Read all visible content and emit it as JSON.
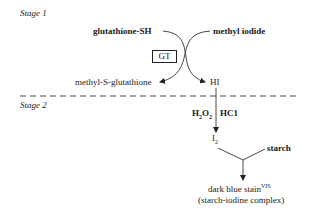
{
  "stage1": {
    "label": "Stage 1",
    "reactant_left": "glutathione-SH",
    "reactant_right": "methyl iodide",
    "enzyme": "GT",
    "product_left": "methyl-S-glutathione",
    "product_right": "HI"
  },
  "stage2": {
    "label": "Stage 2",
    "reagent_left": {
      "base": "H",
      "sub1": "2",
      "mid": "O",
      "sub2": "2"
    },
    "reagent_right": "HC1",
    "intermediate": {
      "base": "I",
      "sub": "2"
    },
    "cosubstrate": "starch",
    "result": {
      "text": "dark blue stain",
      "sup": "VIS"
    },
    "result_note": "(starch-iodine complex)"
  },
  "divider": {
    "style": "dashed"
  }
}
